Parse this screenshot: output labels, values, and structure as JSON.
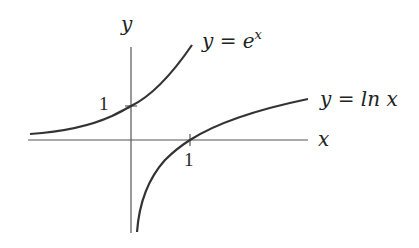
{
  "diagram": {
    "axes": {
      "x_label": "x",
      "y_label": "y",
      "y_tick_label": "1",
      "x_tick_label": "1"
    },
    "curves": [
      {
        "name": "exp",
        "label_lhs": "y = e",
        "label_sup": "x",
        "color": "#333333"
      },
      {
        "name": "ln",
        "label": "y = ln x",
        "color": "#333333"
      }
    ],
    "colors": {
      "axis": "#555555",
      "curve": "#333333",
      "background": "#ffffff"
    }
  }
}
